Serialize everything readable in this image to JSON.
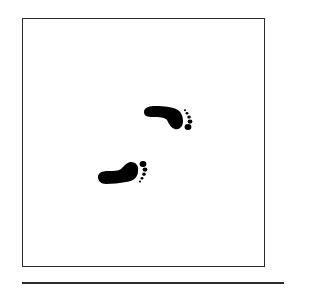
{
  "figure": {
    "type": "footprints-illustration",
    "frame": {
      "stroke_color": "#2a2a2a",
      "fill_color": "#ffffff"
    },
    "footprints": [
      {
        "id": "upper",
        "direction": "right",
        "color": "#000000"
      },
      {
        "id": "lower",
        "direction": "right",
        "color": "#000000"
      }
    ],
    "baseline_rule": {
      "color": "#2a2a2a"
    }
  }
}
